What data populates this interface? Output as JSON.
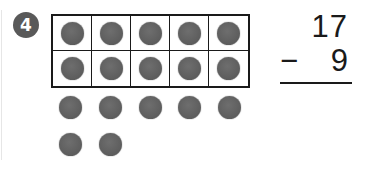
{
  "problem_number": "4",
  "ten_frame": {
    "rows": 2,
    "columns": 5,
    "filled_cells": 10,
    "counter_color": "#5f5f5f"
  },
  "extra_counters": {
    "count": 7,
    "rows": [
      5,
      2
    ]
  },
  "subtraction": {
    "minuend": "17",
    "operator": "−",
    "subtrahend": "9",
    "answer": ""
  }
}
